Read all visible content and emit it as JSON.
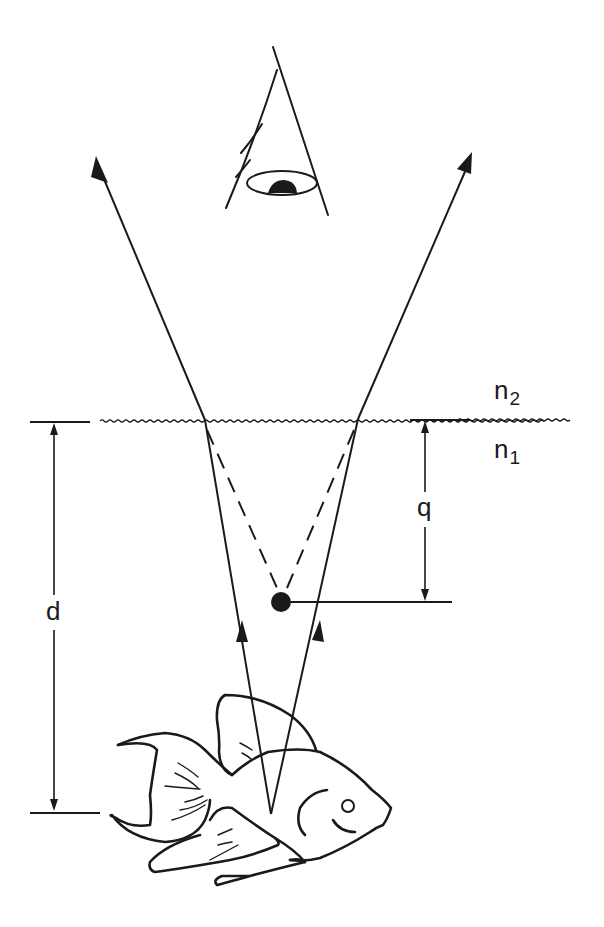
{
  "diagram": {
    "type": "refraction-apparent-depth",
    "labels": {
      "upper_medium": {
        "symbol": "n",
        "subscript": "2"
      },
      "lower_medium": {
        "symbol": "n",
        "subscript": "1"
      },
      "true_depth": "d",
      "apparent_depth": "q"
    },
    "elements": [
      {
        "name": "observer-eye",
        "description": "eye looking down"
      },
      {
        "name": "water-surface",
        "description": "wavy interface line"
      },
      {
        "name": "left-refracted-ray",
        "description": "ray bending away from normal going up"
      },
      {
        "name": "right-refracted-ray",
        "description": "ray bending away from normal going up"
      },
      {
        "name": "virtual-image-dot",
        "description": "apparent position of fish"
      },
      {
        "name": "fish",
        "description": "actual object under water"
      }
    ],
    "colors": {
      "ink": "#1a1a1a",
      "background": "#ffffff"
    }
  }
}
